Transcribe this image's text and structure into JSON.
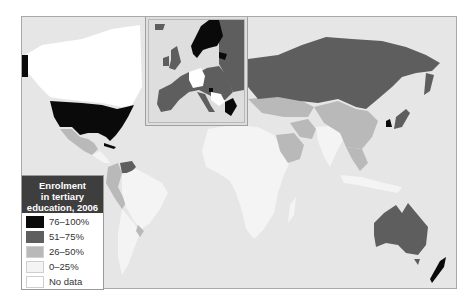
{
  "map": {
    "title": "Enrolment in tertiary education, 2006",
    "colors": {
      "ocean": "#e6e6e6",
      "76-100": "#0a0a0a",
      "51-75": "#5e5e5e",
      "26-50": "#b9b9b9",
      "0-25": "#f4f4f4",
      "no_data": "#ffffff"
    },
    "regions": [
      {
        "name": "United States",
        "class": "76-100"
      },
      {
        "name": "Canada",
        "class": "no_data"
      },
      {
        "name": "Alaska",
        "class": "76-100"
      },
      {
        "name": "Mexico",
        "class": "26-50"
      },
      {
        "name": "Venezuela",
        "class": "51-75"
      },
      {
        "name": "Colombia",
        "class": "26-50"
      },
      {
        "name": "Peru",
        "class": "26-50"
      },
      {
        "name": "Brazil",
        "class": "0-25"
      },
      {
        "name": "Argentina",
        "class": "0-25"
      },
      {
        "name": "Russia",
        "class": "51-75"
      },
      {
        "name": "China",
        "class": "26-50"
      },
      {
        "name": "India",
        "class": "0-25"
      },
      {
        "name": "Saudi Arabia",
        "class": "26-50"
      },
      {
        "name": "Iran",
        "class": "26-50"
      },
      {
        "name": "Africa",
        "class": "0-25"
      },
      {
        "name": "Australia",
        "class": "51-75"
      },
      {
        "name": "New Zealand",
        "class": "76-100"
      },
      {
        "name": "South Korea",
        "class": "76-100"
      },
      {
        "name": "Japan",
        "class": "51-75"
      },
      {
        "name": "Scandinavia",
        "class": "76-100"
      },
      {
        "name": "Western Europe",
        "class": "51-75"
      },
      {
        "name": "Germany",
        "class": "no_data"
      },
      {
        "name": "Greece",
        "class": "76-100"
      },
      {
        "name": "Balkans",
        "class": "no_data"
      }
    ]
  },
  "legend": {
    "title": "Enrolment in tertiary education, 2006",
    "items": [
      {
        "label": "76–100%",
        "color": "#0a0a0a"
      },
      {
        "label": "51–75%",
        "color": "#5e5e5e"
      },
      {
        "label": "26–50%",
        "color": "#b9b9b9"
      },
      {
        "label": "0–25%",
        "color": "#f4f4f4"
      },
      {
        "label": "No data",
        "color": "#ffffff"
      }
    ]
  }
}
